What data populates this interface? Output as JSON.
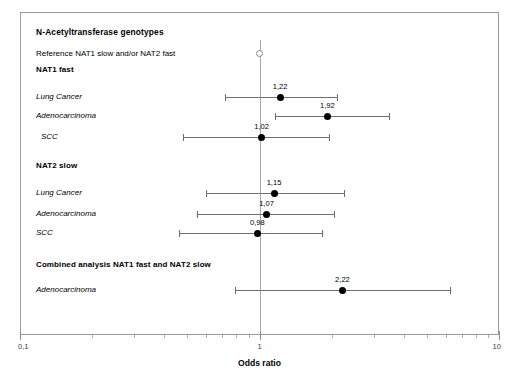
{
  "chart_data": {
    "type": "scatter",
    "plot_kind": "forest-plot",
    "title": "N-Acetyltransferase genotypes",
    "subtitle": "Reference NAT1 slow and/or NAT2 fast",
    "xlabel": "Odds ratio",
    "ylabel": "",
    "xscale": "log",
    "xlim": [
      0.1,
      10
    ],
    "grid": false,
    "legend": null,
    "decimal_separator": ",",
    "xtick_labels": [
      {
        "value": 0.1,
        "label": "0,1"
      },
      {
        "value": 1,
        "label": "1"
      },
      {
        "value": 10,
        "label": "10"
      }
    ],
    "xminor_ticks": [
      0.2,
      0.3,
      0.4,
      0.5,
      0.6,
      0.7,
      0.8,
      0.9,
      2,
      3,
      4,
      5,
      6,
      7,
      8,
      9
    ],
    "reference_marker": {
      "label": "",
      "value": 1.0,
      "style": "open-circle"
    },
    "sections": [
      {
        "heading": "NAT1 fast",
        "rows": [
          {
            "study": "Lung Cancer",
            "or": 1.22,
            "or_label": "1,22",
            "ci_low": 0.72,
            "ci_high": 2.1,
            "marker": "filled-circle"
          },
          {
            "study": "Adenocarcinoma",
            "or": 1.92,
            "or_label": "1,92",
            "ci_low": 1.16,
            "ci_high": 3.46,
            "marker": "filled-circle"
          },
          {
            "study": "SCC",
            "or": 1.02,
            "or_label": "1,02",
            "ci_low": 0.48,
            "ci_high": 1.96,
            "marker": "filled-circle",
            "extra_indent": true
          }
        ]
      },
      {
        "heading": "NAT2 slow",
        "rows": [
          {
            "study": "Lung Cancer",
            "or": 1.15,
            "or_label": "1,15",
            "ci_low": 0.6,
            "ci_high": 2.26,
            "marker": "filled-circle"
          },
          {
            "study": "Adenocarcinoma",
            "or": 1.07,
            "or_label": "1,07",
            "ci_low": 0.55,
            "ci_high": 2.05,
            "marker": "filled-circle"
          },
          {
            "study": "SCC",
            "or": 0.98,
            "or_label": "0,98",
            "ci_low": 0.46,
            "ci_high": 1.83,
            "marker": "filled-circle"
          }
        ]
      },
      {
        "heading": "Combined analysis NAT1 fast and NAT2 slow",
        "rows": [
          {
            "study": "Adenocarcinoma",
            "or": 2.22,
            "or_label": "2,22",
            "ci_low": 0.79,
            "ci_high": 6.22,
            "marker": "filled-circle"
          }
        ]
      }
    ]
  },
  "colors": {
    "frame": "#9a9a9a",
    "reference_line": "#a8a8a8",
    "ci_line": "#6e6e6e",
    "marker_fill": "#000000",
    "axis_text": "#3a3a3a",
    "background": "#ffffff"
  }
}
